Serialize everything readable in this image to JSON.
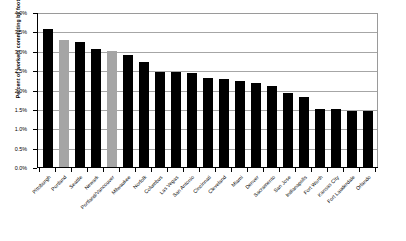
{
  "chart_data": {
    "type": "bar",
    "title": "",
    "xlabel": "",
    "ylabel": "Percent of workers commuting by foot",
    "ylim": [
      0,
      4.0
    ],
    "ytick_labels": [
      "4.0%",
      "3.5%",
      "3.0%",
      "2.5%",
      "2.0%",
      "1.5%",
      "1.0%",
      "0.5%",
      "0.0%"
    ],
    "ytick_values": [
      4.0,
      3.5,
      3.0,
      2.5,
      2.0,
      1.5,
      1.0,
      0.5,
      0.0
    ],
    "grid": true,
    "legend": "none",
    "unit": "percent",
    "categories": [
      "Pittsburgh",
      "Portland",
      "Seattle",
      "Newark",
      "Portland/Vancouver",
      "Milwaukee",
      "Norfolk",
      "Columbus",
      "Las Vegas",
      "San Antonio",
      "Cincinnati",
      "Cleveland",
      "Miami",
      "Denver",
      "Sacramento",
      "San Jose",
      "Indianapolis",
      "Fort Worth",
      "Kansas City",
      "Fort Lauderdale",
      "Orlando"
    ],
    "values": [
      3.57,
      3.29,
      3.23,
      3.05,
      3.0,
      2.9,
      2.71,
      2.44,
      2.44,
      2.43,
      2.3,
      2.27,
      2.23,
      2.18,
      2.1,
      1.9,
      1.8,
      1.5,
      1.5,
      1.45,
      1.45
    ],
    "bar_colors": [
      "#000000",
      "#a5a5a5",
      "#000000",
      "#000000",
      "#a5a5a5",
      "#000000",
      "#000000",
      "#000000",
      "#000000",
      "#000000",
      "#000000",
      "#000000",
      "#000000",
      "#000000",
      "#000000",
      "#000000",
      "#000000",
      "#000000",
      "#000000",
      "#000000",
      "#000000"
    ]
  },
  "colors": {
    "bar_primary": "#000000",
    "bar_highlight": "#a5a5a5",
    "gridline": "#a6a6a6",
    "axis": "#000000",
    "background": "#ffffff"
  }
}
